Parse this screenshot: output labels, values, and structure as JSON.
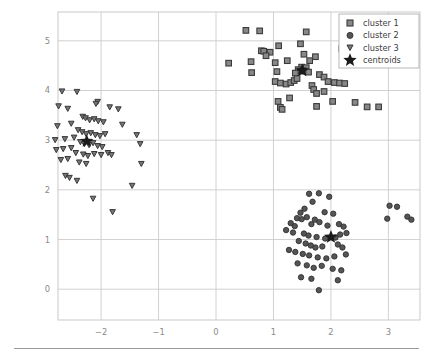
{
  "figure": {
    "background_color": "#ffffff",
    "plot_area": {
      "left": 58,
      "top": 12,
      "right": 420,
      "bottom": 320
    }
  },
  "chart_data": {
    "type": "scatter",
    "title": "",
    "xlabel": "",
    "ylabel": "",
    "xlim": [
      -2.75,
      3.55
    ],
    "ylim": [
      -0.62,
      5.58
    ],
    "xticks": [
      -2,
      -1,
      0,
      1,
      2,
      3
    ],
    "xticklabels": [
      "−2",
      "−1",
      "0",
      "1",
      "2",
      "3"
    ],
    "yticks": [
      0,
      1,
      2,
      3,
      4,
      5
    ],
    "yticklabels": [
      "0",
      "1",
      "2",
      "3",
      "4",
      "5"
    ],
    "grid": true,
    "grid_color": "#cccccc",
    "legend_position": "upper right",
    "series": [
      {
        "name": "cluster 1",
        "marker": "square",
        "color": "#888888",
        "edge_color": "#3a3a3a",
        "points": [
          [
            0.52,
            5.21
          ],
          [
            0.76,
            5.2
          ],
          [
            1.57,
            5.18
          ],
          [
            2.27,
            5.17
          ],
          [
            1.47,
            4.94
          ],
          [
            1.09,
            4.9
          ],
          [
            2.19,
            4.84
          ],
          [
            2.36,
            4.83
          ],
          [
            0.79,
            4.8
          ],
          [
            0.83,
            4.79
          ],
          [
            0.94,
            4.77
          ],
          [
            0.87,
            4.7
          ],
          [
            1.53,
            4.73
          ],
          [
            0.61,
            4.58
          ],
          [
            1.03,
            4.56
          ],
          [
            1.24,
            4.6
          ],
          [
            1.63,
            4.6
          ],
          [
            1.73,
            4.68
          ],
          [
            1.49,
            4.47
          ],
          [
            1.57,
            4.46
          ],
          [
            1.43,
            4.42
          ],
          [
            1.47,
            4.39
          ],
          [
            1.52,
            4.4
          ],
          [
            1.61,
            4.37
          ],
          [
            1.38,
            4.35
          ],
          [
            0.62,
            4.36
          ],
          [
            1.06,
            4.38
          ],
          [
            1.8,
            4.32
          ],
          [
            1.88,
            4.27
          ],
          [
            1.03,
            4.18
          ],
          [
            1.12,
            4.15
          ],
          [
            1.22,
            4.13
          ],
          [
            1.3,
            4.16
          ],
          [
            1.36,
            4.2
          ],
          [
            1.41,
            4.24
          ],
          [
            1.95,
            4.18
          ],
          [
            2.06,
            4.16
          ],
          [
            2.15,
            4.15
          ],
          [
            2.24,
            4.14
          ],
          [
            1.67,
            4.1
          ],
          [
            1.7,
            4.02
          ],
          [
            1.75,
            3.94
          ],
          [
            1.88,
            3.98
          ],
          [
            1.28,
            3.85
          ],
          [
            1.08,
            3.78
          ],
          [
            2.03,
            3.78
          ],
          [
            2.42,
            3.76
          ],
          [
            1.12,
            3.66
          ],
          [
            1.15,
            3.62
          ],
          [
            1.75,
            3.68
          ],
          [
            2.63,
            3.67
          ],
          [
            2.83,
            3.67
          ],
          [
            0.22,
            4.55
          ]
        ]
      },
      {
        "name": "cluster 2",
        "marker": "circle",
        "color": "#555555",
        "edge_color": "#303030",
        "points": [
          [
            1.62,
            1.92
          ],
          [
            1.79,
            1.93
          ],
          [
            1.97,
            1.86
          ],
          [
            1.68,
            1.76
          ],
          [
            1.54,
            1.62
          ],
          [
            1.47,
            1.54
          ],
          [
            1.89,
            1.55
          ],
          [
            2.04,
            1.52
          ],
          [
            1.41,
            1.43
          ],
          [
            1.49,
            1.41
          ],
          [
            1.58,
            1.45
          ],
          [
            1.72,
            1.4
          ],
          [
            1.3,
            1.33
          ],
          [
            1.37,
            1.27
          ],
          [
            1.66,
            1.31
          ],
          [
            1.8,
            1.35
          ],
          [
            1.94,
            1.28
          ],
          [
            2.14,
            1.31
          ],
          [
            2.22,
            1.26
          ],
          [
            1.22,
            1.19
          ],
          [
            1.34,
            1.14
          ],
          [
            1.53,
            1.12
          ],
          [
            1.61,
            1.08
          ],
          [
            1.75,
            1.05
          ],
          [
            1.9,
            1.02
          ],
          [
            2.08,
            1.04
          ],
          [
            2.16,
            1.1
          ],
          [
            2.27,
            1.13
          ],
          [
            1.44,
            0.97
          ],
          [
            1.56,
            0.92
          ],
          [
            1.65,
            0.88
          ],
          [
            1.73,
            0.84
          ],
          [
            1.85,
            0.86
          ],
          [
            2.12,
            0.9
          ],
          [
            2.2,
            0.84
          ],
          [
            1.27,
            0.79
          ],
          [
            1.38,
            0.75
          ],
          [
            1.51,
            0.71
          ],
          [
            1.62,
            0.68
          ],
          [
            1.77,
            0.64
          ],
          [
            1.92,
            0.62
          ],
          [
            2.06,
            0.66
          ],
          [
            2.26,
            0.7
          ],
          [
            1.42,
            0.52
          ],
          [
            1.58,
            0.48
          ],
          [
            1.7,
            0.43
          ],
          [
            1.84,
            0.47
          ],
          [
            2.03,
            0.41
          ],
          [
            2.18,
            0.38
          ],
          [
            1.48,
            0.24
          ],
          [
            1.66,
            0.21
          ],
          [
            2.12,
            0.18
          ],
          [
            1.79,
            -0.02
          ],
          [
            3.02,
            1.68
          ],
          [
            3.15,
            1.66
          ],
          [
            3.33,
            1.46
          ],
          [
            2.98,
            1.42
          ],
          [
            3.4,
            1.4
          ]
        ]
      },
      {
        "name": "cluster 3",
        "marker": "triangle-down",
        "color": "#777777",
        "edge_color": "#383838",
        "points": [
          [
            -2.68,
            3.98
          ],
          [
            -2.42,
            3.97
          ],
          [
            -2.06,
            3.77
          ],
          [
            -2.09,
            3.73
          ],
          [
            -2.74,
            3.68
          ],
          [
            -2.58,
            3.63
          ],
          [
            -1.85,
            3.66
          ],
          [
            -1.7,
            3.62
          ],
          [
            -2.32,
            3.47
          ],
          [
            -2.27,
            3.44
          ],
          [
            -2.2,
            3.4
          ],
          [
            -2.12,
            3.42
          ],
          [
            -2.05,
            3.38
          ],
          [
            -1.96,
            3.36
          ],
          [
            -2.52,
            3.33
          ],
          [
            -2.76,
            3.28
          ],
          [
            -2.4,
            3.2
          ],
          [
            -2.33,
            3.16
          ],
          [
            -2.26,
            3.12
          ],
          [
            -2.18,
            3.14
          ],
          [
            -2.1,
            3.1
          ],
          [
            -2.02,
            3.08
          ],
          [
            -1.93,
            3.12
          ],
          [
            -2.47,
            3.05
          ],
          [
            -2.63,
            3.02
          ],
          [
            -2.8,
            3.0
          ],
          [
            -2.36,
            2.96
          ],
          [
            -2.29,
            2.92
          ],
          [
            -2.21,
            2.9
          ],
          [
            -2.14,
            2.94
          ],
          [
            -2.06,
            2.88
          ],
          [
            -1.98,
            2.86
          ],
          [
            -2.52,
            2.84
          ],
          [
            -2.66,
            2.82
          ],
          [
            -2.78,
            2.8
          ],
          [
            -2.44,
            2.74
          ],
          [
            -2.31,
            2.71
          ],
          [
            -2.23,
            2.68
          ],
          [
            -2.12,
            2.72
          ],
          [
            -2.0,
            2.7
          ],
          [
            -1.88,
            2.74
          ],
          [
            -1.82,
            2.7
          ],
          [
            -2.58,
            2.62
          ],
          [
            -2.7,
            2.6
          ],
          [
            -2.38,
            2.55
          ],
          [
            -2.26,
            2.52
          ],
          [
            -2.62,
            2.28
          ],
          [
            -2.55,
            2.24
          ],
          [
            -2.42,
            2.18
          ],
          [
            -1.63,
            3.31
          ],
          [
            -1.38,
            3.1
          ],
          [
            -1.32,
            2.92
          ],
          [
            -1.3,
            2.52
          ],
          [
            -1.46,
            2.08
          ],
          [
            -2.14,
            1.82
          ],
          [
            -1.8,
            1.55
          ]
        ]
      }
    ],
    "centroids": {
      "name": "centroids",
      "marker": "star",
      "color": "#1a1a1a",
      "points": [
        [
          1.5,
          4.4
        ],
        [
          2.0,
          1.05
        ],
        [
          -2.25,
          2.98
        ]
      ]
    }
  },
  "legend": {
    "entries": [
      {
        "label": "cluster 1",
        "marker": "square",
        "marker_name": "square-marker-icon"
      },
      {
        "label": "cluster 2",
        "marker": "circle",
        "marker_name": "circle-marker-icon"
      },
      {
        "label": "cluster 3",
        "marker": "triangle-down",
        "marker_name": "triangle-down-marker-icon"
      },
      {
        "label": "centroids",
        "marker": "star",
        "marker_name": "star-marker-icon"
      }
    ],
    "frame_color": "#b0b0b0",
    "background_color": "#ffffff"
  }
}
